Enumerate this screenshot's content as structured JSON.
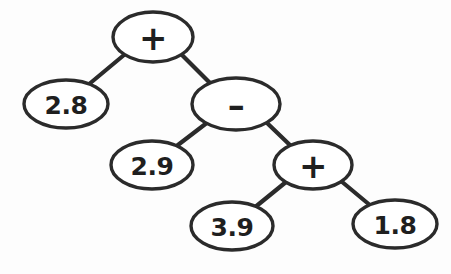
{
  "figure": {
    "kind": "binary-expression-tree",
    "style": "hand-drawn",
    "background_color": "#fdfdfd",
    "stroke_color": "#2b2b2b",
    "node_fill_color": "#ffffff",
    "text_color": "#1f1f1f",
    "expression": "2.8 + (2.9 - (3.9 + 1.8))"
  },
  "nodes": [
    {
      "id": "root-plus",
      "label": "+",
      "role": "operator",
      "cx": 153,
      "cy": 37,
      "rx": 40,
      "ry": 25
    },
    {
      "id": "leaf-2-8",
      "label": "2.8",
      "role": "operand",
      "cx": 66,
      "cy": 104,
      "rx": 42,
      "ry": 24
    },
    {
      "id": "minus",
      "label": "–",
      "role": "operator",
      "cx": 236,
      "cy": 104,
      "rx": 44,
      "ry": 26
    },
    {
      "id": "leaf-2-9",
      "label": "2.9",
      "role": "operand",
      "cx": 152,
      "cy": 165,
      "rx": 41,
      "ry": 24
    },
    {
      "id": "mid-plus",
      "label": "+",
      "role": "operator",
      "cx": 313,
      "cy": 165,
      "rx": 39,
      "ry": 24
    },
    {
      "id": "leaf-3-9",
      "label": "3.9",
      "role": "operand",
      "cx": 232,
      "cy": 226,
      "rx": 41,
      "ry": 24
    },
    {
      "id": "leaf-1-8",
      "label": "1.8",
      "role": "operand",
      "cx": 395,
      "cy": 224,
      "rx": 42,
      "ry": 24
    }
  ],
  "edges": [
    {
      "id": "edge-root-to-2-8",
      "from": "root-plus",
      "to": "leaf-2-8",
      "x1": 124,
      "y1": 55,
      "x2": 88,
      "y2": 85
    },
    {
      "id": "edge-root-to-minus",
      "from": "root-plus",
      "to": "minus",
      "x1": 182,
      "y1": 55,
      "x2": 212,
      "y2": 85
    },
    {
      "id": "edge-minus-to-2-9",
      "from": "minus",
      "to": "leaf-2-9",
      "x1": 208,
      "y1": 122,
      "x2": 174,
      "y2": 148
    },
    {
      "id": "edge-minus-to-plus",
      "from": "minus",
      "to": "mid-plus",
      "x1": 266,
      "y1": 122,
      "x2": 292,
      "y2": 147
    },
    {
      "id": "edge-plus-to-3-9",
      "from": "mid-plus",
      "to": "leaf-3-9",
      "x1": 286,
      "y1": 182,
      "x2": 254,
      "y2": 208
    },
    {
      "id": "edge-plus-to-1-8",
      "from": "mid-plus",
      "to": "leaf-1-8",
      "x1": 341,
      "y1": 181,
      "x2": 371,
      "y2": 206
    }
  ]
}
